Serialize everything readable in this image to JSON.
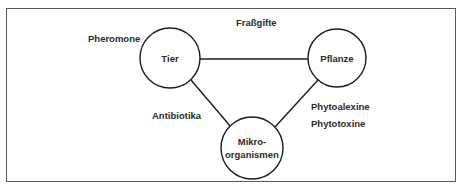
{
  "figure": {
    "border_color": "#5a5a5a",
    "background_color": "#ffffff",
    "ink_color": "#1c1c1c",
    "text_color": "#2b2b2b"
  },
  "nodes": [
    {
      "id": "tier",
      "label": "Tier",
      "cx": 170,
      "cy": 58,
      "r": 30
    },
    {
      "id": "pflanze",
      "label": "Pflanze",
      "cx": 337,
      "cy": 58,
      "r": 29
    },
    {
      "id": "mikroorganismen",
      "label_line1": "Mikro-",
      "label_line2": "organismen",
      "cx": 252,
      "cy": 148,
      "r": 31
    }
  ],
  "edges": [
    {
      "id": "tier-pflanze",
      "from": "tier",
      "to": "pflanze",
      "x1": 200,
      "y1": 59,
      "x2": 308,
      "y2": 59
    },
    {
      "id": "tier-mikroorganismen",
      "from": "tier",
      "to": "mikroorganismen",
      "x1": 191,
      "y1": 80,
      "x2": 231,
      "y2": 127
    },
    {
      "id": "pflanze-mikroorganismen",
      "from": "pflanze",
      "to": "mikroorganismen",
      "x1": 318,
      "y1": 80,
      "x2": 275,
      "y2": 127
    }
  ],
  "edge_labels": [
    {
      "id": "pheromone",
      "text": "Pheromone",
      "x": 88,
      "y": 42
    },
    {
      "id": "frassgifte",
      "text": "Fraßgifte",
      "x": 236,
      "y": 26
    },
    {
      "id": "antibiotika",
      "text": "Antibiotika",
      "x": 152,
      "y": 119
    },
    {
      "id": "phytoalexine",
      "text": "Phytoalexine",
      "x": 311,
      "y": 110
    },
    {
      "id": "phytotoxine",
      "text": "Phytotoxine",
      "x": 311,
      "y": 127
    }
  ]
}
